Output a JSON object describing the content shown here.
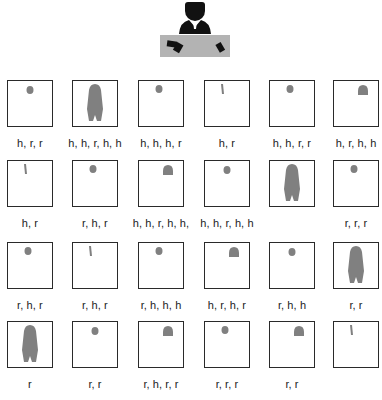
{
  "colors": {
    "silhouette": "#808080",
    "teacher": "#111111",
    "desk": "#b3b3b3",
    "border": "#2a2a2a"
  },
  "teacher": {
    "icon": "teacher-at-desk-icon"
  },
  "students": [
    {
      "row": 1,
      "col": 1,
      "pose": "desk-front",
      "label": "h, r, r"
    },
    {
      "row": 1,
      "col": 2,
      "pose": "standing-arms-out",
      "label": "h, h, r, h, h"
    },
    {
      "row": 1,
      "col": 3,
      "pose": "desk-front-wide",
      "label": "h, h, h, r"
    },
    {
      "row": 1,
      "col": 4,
      "pose": "hand-raised",
      "label": "h, r"
    },
    {
      "row": 1,
      "col": 5,
      "pose": "desk-front-wide",
      "label": "h, h, r, r"
    },
    {
      "row": 1,
      "col": 6,
      "pose": "desk-side",
      "label": "h, r, h, h"
    },
    {
      "row": 2,
      "col": 1,
      "pose": "hand-raised",
      "label": "h, r"
    },
    {
      "row": 2,
      "col": 2,
      "pose": "desk-front-wide",
      "label": "r, h, r"
    },
    {
      "row": 2,
      "col": 3,
      "pose": "desk-side",
      "label": "h, h, r, h, h,"
    },
    {
      "row": 2,
      "col": 4,
      "pose": "desk-front",
      "label": "h, h, r, h, h"
    },
    {
      "row": 2,
      "col": 5,
      "pose": "standing-arms-out",
      "label": ""
    },
    {
      "row": 2,
      "col": 6,
      "pose": "desk-front-wide",
      "label": "r, r, r"
    },
    {
      "row": 3,
      "col": 1,
      "pose": "desk-front-wide",
      "label": "r, h, r"
    },
    {
      "row": 3,
      "col": 2,
      "pose": "hand-raised",
      "label": "r, h, r"
    },
    {
      "row": 3,
      "col": 3,
      "pose": "desk-front-wide",
      "label": "r, h, h, h"
    },
    {
      "row": 3,
      "col": 4,
      "pose": "desk-side",
      "label": "h, r, h, r"
    },
    {
      "row": 3,
      "col": 5,
      "pose": "desk-front",
      "label": "r, h, h"
    },
    {
      "row": 3,
      "col": 6,
      "pose": "standing-arms-out",
      "label": "r, r"
    },
    {
      "row": 4,
      "col": 1,
      "pose": "standing-arms-out",
      "label": "r"
    },
    {
      "row": 4,
      "col": 2,
      "pose": "desk-front",
      "label": "r, r"
    },
    {
      "row": 4,
      "col": 3,
      "pose": "desk-side",
      "label": "r, h, r, r"
    },
    {
      "row": 4,
      "col": 4,
      "pose": "desk-front-wide",
      "label": "r, r, r"
    },
    {
      "row": 4,
      "col": 5,
      "pose": "desk-side",
      "label": "r, r"
    },
    {
      "row": 4,
      "col": 6,
      "pose": "hand-raised",
      "label": ""
    }
  ]
}
